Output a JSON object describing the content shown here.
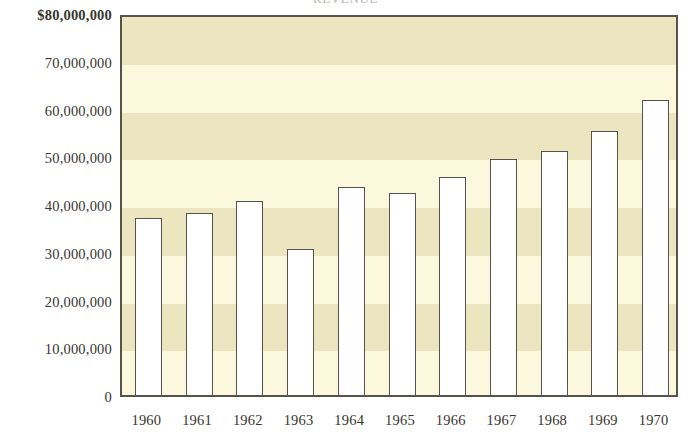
{
  "chart_data": {
    "type": "bar",
    "title": "REVENUE",
    "title_cropped": true,
    "xlabel": "",
    "ylabel": "",
    "categories": [
      "1960",
      "1961",
      "1962",
      "1963",
      "1964",
      "1965",
      "1966",
      "1967",
      "1968",
      "1969",
      "1970"
    ],
    "values": [
      38000000,
      38900000,
      41500000,
      31400000,
      44300000,
      43100000,
      46400000,
      50200000,
      51900000,
      56100000,
      62700000
    ],
    "ylim": [
      0,
      80000000
    ],
    "ytick_values": [
      80000000,
      70000000,
      60000000,
      50000000,
      40000000,
      30000000,
      20000000,
      10000000,
      0
    ],
    "ytick_labels": [
      "$80,000,000",
      "70,000,000",
      "60,000,000",
      "50,000,000",
      "40,000,000",
      "30,000,000",
      "20,000,000",
      "10,000,000",
      "0"
    ],
    "grid": false,
    "banded_background": true,
    "legend": null,
    "series": [
      {
        "name": "Revenue",
        "values": [
          38000000,
          38900000,
          41500000,
          31400000,
          44300000,
          43100000,
          46400000,
          50200000,
          51900000,
          56100000,
          62700000
        ]
      }
    ],
    "annotations": []
  },
  "style": {
    "band_dark": "#ebe5c0",
    "band_light": "#fbf8de",
    "bar_fill": "#ffffff",
    "bar_stroke": "#55534c",
    "frame_stroke": "#55534c",
    "text_color": "#38362f",
    "page_background": "#ffffff"
  }
}
